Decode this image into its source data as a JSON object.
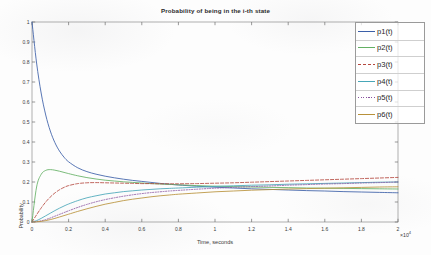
{
  "chart_data": {
    "type": "line",
    "title": "Probability of being in the i-th state",
    "xlabel": "Time, seconds",
    "ylabel": "Probability",
    "x_exponent_label": "×10",
    "x_exponent_power": "4",
    "xlim": [
      0,
      20000
    ],
    "ylim": [
      0,
      1
    ],
    "xticks": [
      0,
      2000,
      4000,
      6000,
      8000,
      10000,
      12000,
      14000,
      16000,
      18000,
      20000
    ],
    "xticklabels": [
      "0",
      "0.2",
      "0.4",
      "0.6",
      "0.8",
      "1",
      "1.2",
      "1.4",
      "1.6",
      "1.8",
      "2"
    ],
    "yticks": [
      0,
      0.1,
      0.2,
      0.3,
      0.4,
      0.5,
      0.6,
      0.7,
      0.8,
      0.9,
      1
    ],
    "yticklabels": [
      "0",
      "0.1",
      "0.2",
      "0.3",
      "0.4",
      "0.5",
      "0.6",
      "0.7",
      "0.8",
      "0.9",
      "1"
    ],
    "grid": false,
    "legend_position": "upper-right",
    "x": [
      0,
      250,
      500,
      750,
      1000,
      1250,
      1500,
      1750,
      2000,
      2500,
      3000,
      3500,
      4000,
      4500,
      5000,
      5500,
      6000,
      6500,
      7000,
      7500,
      8000,
      9000,
      10000,
      11000,
      12000,
      13000,
      14000,
      15000,
      16000,
      17000,
      18000,
      19000,
      20000
    ],
    "series": [
      {
        "name": "p1(t)",
        "color": "#3b5fa8",
        "style": "solid",
        "values": [
          1.0,
          0.795,
          0.645,
          0.535,
          0.455,
          0.397,
          0.355,
          0.324,
          0.301,
          0.271,
          0.252,
          0.239,
          0.229,
          0.221,
          0.214,
          0.208,
          0.203,
          0.198,
          0.193,
          0.189,
          0.185,
          0.179,
          0.174,
          0.17,
          0.166,
          0.163,
          0.16,
          0.157,
          0.155,
          0.152,
          0.15,
          0.148,
          0.146
        ]
      },
      {
        "name": "p2(t)",
        "color": "#63b063",
        "style": "solid",
        "values": [
          0.0,
          0.175,
          0.238,
          0.258,
          0.262,
          0.259,
          0.254,
          0.248,
          0.242,
          0.231,
          0.222,
          0.215,
          0.209,
          0.205,
          0.201,
          0.198,
          0.195,
          0.192,
          0.19,
          0.188,
          0.186,
          0.182,
          0.179,
          0.177,
          0.175,
          0.173,
          0.172,
          0.17,
          0.169,
          0.168,
          0.167,
          0.166,
          0.165
        ]
      },
      {
        "name": "p3(t)",
        "color": "#b5483f",
        "style": "dashed",
        "values": [
          0.0,
          0.036,
          0.07,
          0.1,
          0.125,
          0.145,
          0.161,
          0.173,
          0.182,
          0.192,
          0.196,
          0.197,
          0.196,
          0.195,
          0.194,
          0.193,
          0.192,
          0.192,
          0.191,
          0.191,
          0.191,
          0.192,
          0.194,
          0.196,
          0.199,
          0.202,
          0.205,
          0.208,
          0.211,
          0.214,
          0.217,
          0.22,
          0.223
        ]
      },
      {
        "name": "p4(t)",
        "color": "#48a7b8",
        "style": "solid",
        "values": [
          0.0,
          0.007,
          0.018,
          0.031,
          0.044,
          0.057,
          0.069,
          0.08,
          0.09,
          0.107,
          0.121,
          0.131,
          0.14,
          0.146,
          0.152,
          0.156,
          0.16,
          0.163,
          0.166,
          0.168,
          0.17,
          0.174,
          0.178,
          0.181,
          0.184,
          0.186,
          0.189,
          0.191,
          0.193,
          0.195,
          0.197,
          0.199,
          0.2
        ]
      },
      {
        "name": "p5(t)",
        "color": "#8a54a0",
        "style": "dotted",
        "values": [
          0.0,
          0.002,
          0.006,
          0.012,
          0.02,
          0.029,
          0.038,
          0.047,
          0.056,
          0.073,
          0.088,
          0.101,
          0.112,
          0.121,
          0.129,
          0.136,
          0.142,
          0.147,
          0.151,
          0.155,
          0.158,
          0.164,
          0.169,
          0.173,
          0.177,
          0.18,
          0.184,
          0.187,
          0.19,
          0.192,
          0.195,
          0.197,
          0.2
        ]
      },
      {
        "name": "p6(t)",
        "color": "#b8913a",
        "style": "solid",
        "values": [
          0.0,
          0.001,
          0.003,
          0.007,
          0.012,
          0.018,
          0.025,
          0.032,
          0.039,
          0.053,
          0.066,
          0.078,
          0.089,
          0.098,
          0.107,
          0.114,
          0.12,
          0.126,
          0.131,
          0.135,
          0.139,
          0.145,
          0.151,
          0.155,
          0.159,
          0.162,
          0.165,
          0.167,
          0.169,
          0.171,
          0.173,
          0.175,
          0.176
        ]
      }
    ]
  },
  "legend": {
    "items": [
      {
        "label": "p1(t)"
      },
      {
        "label": "p2(t)"
      },
      {
        "label": "p3(t)"
      },
      {
        "label": "p4(t)"
      },
      {
        "label": "p5(t)"
      },
      {
        "label": "p6(t)"
      }
    ]
  }
}
